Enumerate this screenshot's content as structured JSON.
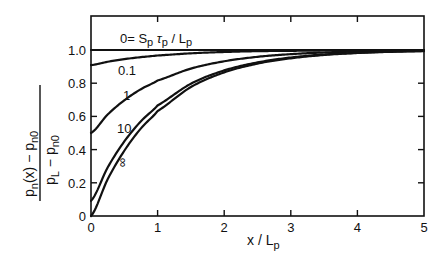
{
  "chart_data": {
    "type": "line",
    "title": "",
    "xlabel": "x/L_p",
    "ylabel": "(p_n(x) - p_n0) / (p_L - p_n0)",
    "xlim": [
      0,
      5
    ],
    "ylim": [
      0,
      1.2
    ],
    "grid": false,
    "legend": "inline curve labels",
    "parameter_label": "0 = S_p τ_p / L_p",
    "x_ticks": [
      0,
      1,
      2,
      3,
      4,
      5
    ],
    "x_tick_labels": [
      "0",
      "1",
      "2",
      "3",
      "4",
      "5"
    ],
    "y_ticks": [
      0,
      0.2,
      0.4,
      0.6,
      0.8,
      1.0
    ],
    "y_tick_labels": [
      "0",
      "0.2",
      "0.4",
      "0.6",
      "0.8",
      "1.0"
    ],
    "x": [
      0,
      0.25,
      0.5,
      0.75,
      1,
      1.5,
      2,
      2.5,
      3,
      3.5,
      4,
      4.5,
      5
    ],
    "series": [
      {
        "name": "0",
        "label": "0",
        "values": [
          1.0,
          1.0,
          1.0,
          1.0,
          1.0,
          1.0,
          1.0,
          1.0,
          1.0,
          1.0,
          1.0,
          1.0,
          1.0
        ]
      },
      {
        "name": "0.1",
        "label": "0.1",
        "values": [
          0.909,
          0.929,
          0.945,
          0.957,
          0.967,
          0.98,
          0.988,
          0.993,
          0.995,
          0.997,
          0.998,
          0.999,
          0.999
        ]
      },
      {
        "name": "1",
        "label": "1",
        "values": [
          0.5,
          0.611,
          0.697,
          0.764,
          0.816,
          0.888,
          0.932,
          0.959,
          0.975,
          0.985,
          0.991,
          0.994,
          0.997
        ]
      },
      {
        "name": "10",
        "label": "10",
        "values": [
          0.091,
          0.292,
          0.449,
          0.571,
          0.666,
          0.797,
          0.877,
          0.925,
          0.955,
          0.973,
          0.983,
          0.99,
          0.994
        ]
      },
      {
        "name": "∞",
        "label": "∞",
        "values": [
          0.0,
          0.221,
          0.393,
          0.528,
          0.632,
          0.777,
          0.865,
          0.918,
          0.95,
          0.97,
          0.982,
          0.989,
          0.993
        ]
      }
    ]
  },
  "labels": {
    "param": "0= Sp τp / Lp",
    "ylabel_num": "pn(x) − pn0",
    "ylabel_den": "pL − pn0",
    "xlabel": "x/Lp"
  }
}
